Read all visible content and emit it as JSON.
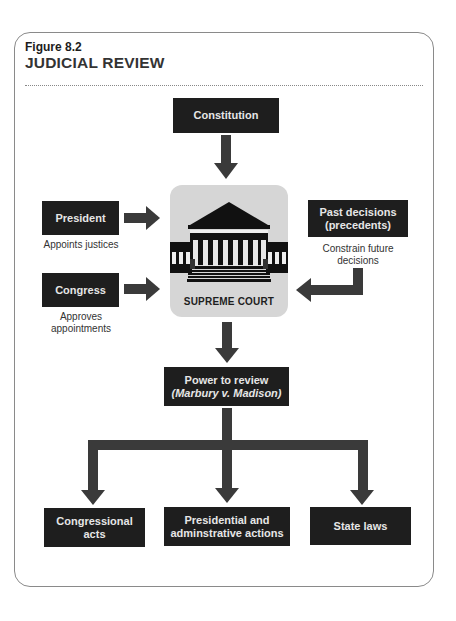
{
  "figure": {
    "label": "Figure 8.2",
    "title": "JUDICIAL REVIEW"
  },
  "nodes": {
    "constitution": {
      "label": "Constitution"
    },
    "president": {
      "label": "President",
      "caption": "Appoints justices"
    },
    "congress": {
      "label": "Congress",
      "caption_line1": "Approves",
      "caption_line2": "appointments"
    },
    "past_decisions": {
      "line1": "Past decisions",
      "line2": "(precedents)",
      "caption_line1": "Constrain future",
      "caption_line2": "decisions"
    },
    "supreme_court": {
      "label": "SUPREME COURT",
      "icon": "courthouse-icon"
    },
    "power_to_review": {
      "line1": "Power to review",
      "line2": "(Marbury v. Madison)"
    },
    "congressional_acts": {
      "line1": "Congressional",
      "line2": "acts"
    },
    "presidential_actions": {
      "line1": "Presidential and",
      "line2": "adminstrative actions"
    },
    "state_laws": {
      "label": "State laws"
    }
  },
  "edges": [
    {
      "from": "Constitution",
      "to": "SUPREME COURT"
    },
    {
      "from": "President",
      "to": "SUPREME COURT"
    },
    {
      "from": "Congress",
      "to": "SUPREME COURT"
    },
    {
      "from": "Past decisions (precedents)",
      "to": "SUPREME COURT"
    },
    {
      "from": "SUPREME COURT",
      "to": "Power to review (Marbury v. Madison)"
    },
    {
      "from": "Power to review (Marbury v. Madison)",
      "to": "Congressional acts"
    },
    {
      "from": "Power to review (Marbury v. Madison)",
      "to": "Presidential and adminstrative actions"
    },
    {
      "from": "Power to review (Marbury v. Madison)",
      "to": "State laws"
    }
  ],
  "colors": {
    "box_fill": "#1e1e1e",
    "box_text": "#e6e6e6",
    "arrow": "#3a3a3a",
    "court_panel": "#d6d6d6",
    "frame_border": "#8a8a8a"
  }
}
